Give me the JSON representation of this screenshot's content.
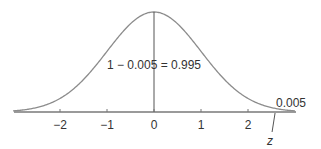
{
  "chart_data": {
    "type": "line",
    "title": "",
    "xlim": [
      -3,
      3
    ],
    "x_ticks": [
      -2,
      -1,
      0,
      1,
      2
    ],
    "x_tick_labels": [
      "−2",
      "−1",
      "0",
      "1",
      "2"
    ],
    "z_value": 2.576,
    "z_label": "z",
    "center_label": "1 − 0.005 = 0.995",
    "tail_label": "0.005",
    "colors": {
      "curve": "#8c8c8c",
      "axis": "#9a9a9a",
      "text": "#333333"
    }
  }
}
